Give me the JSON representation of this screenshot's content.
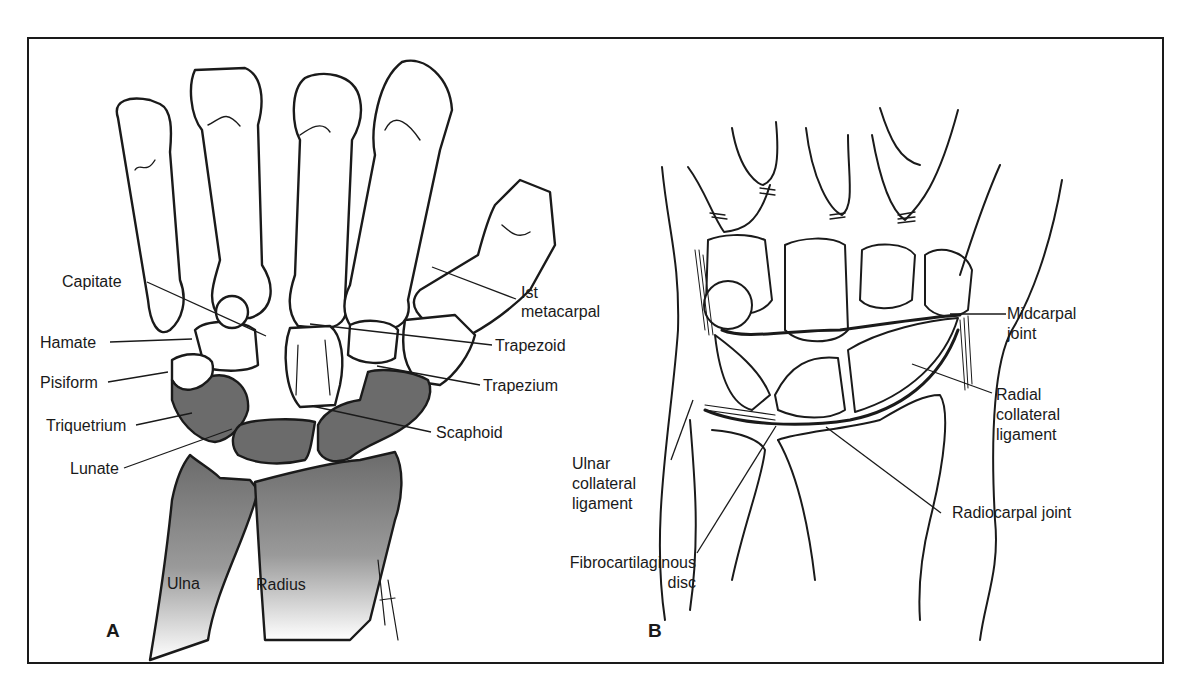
{
  "figure": {
    "panels": [
      {
        "id": "A",
        "letter": "A",
        "labels": {
          "capitate": "Capitate",
          "hamate": "Hamate",
          "pisiform": "Pisiform",
          "triquetrium": "Triquetrium",
          "lunate": "Lunate",
          "first_metacarpal_l1": "Ist",
          "first_metacarpal_l2": "metacarpal",
          "trapezoid": "Trapezoid",
          "trapezium": "Trapezium",
          "scaphoid": "Scaphoid",
          "ulna": "Ulna",
          "radius": "Radius"
        },
        "signature": "BATISTA"
      },
      {
        "id": "B",
        "letter": "B",
        "labels": {
          "midcarpal_l1": "Midcarpal",
          "midcarpal_l2": "joint",
          "radial_collateral_l1": "Radial",
          "radial_collateral_l2": "collateral",
          "radial_collateral_l3": "ligament",
          "ulnar_collateral_l1": "Ulnar",
          "ulnar_collateral_l2": "collateral",
          "ulnar_collateral_l3": "ligament",
          "radiocarpal": "Radiocarpal joint",
          "fibro_l1": "Fibrocartilaginous",
          "fibro_l2": "disc"
        }
      }
    ],
    "colors": {
      "line": "#1a1a1a",
      "shaded_bone": "#6b6b6b",
      "background": "#ffffff"
    }
  }
}
